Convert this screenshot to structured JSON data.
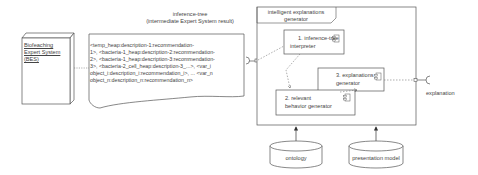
{
  "bes": {
    "lines": [
      "Biofeaching",
      "Expert System",
      "(BES)"
    ]
  },
  "document": {
    "title": "inference-tree",
    "subtitle": "(intermediate Expert System result)",
    "lines": [
      "<temp_heap:description-1:recommendation-",
      "1>, <bacteria-1_heap:description-2:recommendation-",
      "2>, <bacteria-1_heap:description-3:recommendation-",
      "3>, <bacteria-2_cell_heap:description-3_...>, <var_i",
      "object_i:description_i:recommendation_i>, ... <var_n",
      "object_n:description_n:recommendation_n>"
    ]
  },
  "generator": {
    "title_line1": "intelligent explanations",
    "title_line2": "generator",
    "components": [
      {
        "line1": "1. inference-tree",
        "line2": "interpreter"
      },
      {
        "line1": "2. relevant",
        "line2": "behavior generator"
      },
      {
        "line1": "3. explanations",
        "line2": "generator"
      }
    ]
  },
  "interface": {
    "label": "explanation"
  },
  "databases": [
    {
      "label": "ontology"
    },
    {
      "label": "presentation model"
    }
  ]
}
